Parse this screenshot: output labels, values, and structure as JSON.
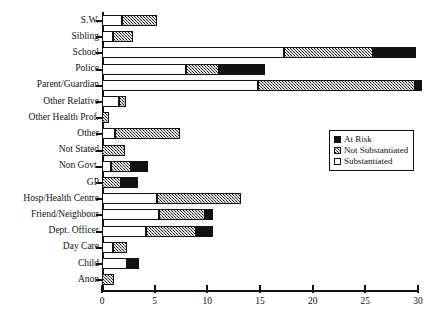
{
  "artifact": {
    "clipped_text_top": ""
  },
  "legend": {
    "position": "inside-right-middle",
    "items": [
      {
        "key": "at_risk",
        "label": "At Risk",
        "swatch": "solid-black",
        "color": "#111111"
      },
      {
        "key": "not_substantiated",
        "label": "Not Substantiated",
        "swatch": "stipple",
        "color": "#6e6e6e"
      },
      {
        "key": "substantiated",
        "label": "Substantiated",
        "swatch": "open-white",
        "color": "#ffffff"
      }
    ]
  },
  "axis": {
    "x_ticks": [
      "0",
      "5",
      "10",
      "15",
      "20",
      "25",
      "30"
    ],
    "x_min": 0,
    "x_max": 30
  },
  "chart_data": {
    "type": "bar",
    "orientation": "horizontal",
    "stacked": true,
    "title": "",
    "xlabel": "",
    "ylabel": "",
    "xlim": [
      0,
      30
    ],
    "ylim": null,
    "grid": false,
    "legend_position": "center-right",
    "xticks": [
      0,
      5,
      10,
      15,
      20,
      25,
      30
    ],
    "categories": [
      "S.W.",
      "Sibling",
      "School",
      "Police",
      "Parent/Guardian",
      "Other Relative",
      "Other Health Prof.",
      "Other",
      "Not Stated",
      "Non Govt.",
      "GP",
      "Hosp/Health Centre",
      "Friend/Neighbour",
      "Dept. Officer",
      "Day Care",
      "Child",
      "Anon"
    ],
    "series": [
      {
        "name": "Substantiated",
        "color": "#ffffff",
        "values": [
          1.9,
          1.0,
          17.3,
          8.0,
          14.8,
          1.6,
          0.0,
          1.2,
          0.0,
          0.9,
          0.0,
          5.2,
          5.4,
          4.2,
          1.0,
          2.4,
          0.0
        ]
      },
      {
        "name": "Not Substantiated",
        "color": "#6e6e6e",
        "values": [
          3.3,
          1.9,
          8.4,
          3.1,
          14.9,
          0.7,
          0.7,
          6.2,
          2.2,
          1.9,
          1.8,
          8.0,
          4.4,
          4.7,
          1.4,
          0.0,
          1.1
        ]
      },
      {
        "name": "At Risk",
        "color": "#111111",
        "values": [
          0.0,
          0.0,
          4.1,
          4.4,
          0.7,
          0.0,
          0.0,
          0.0,
          0.0,
          1.6,
          1.6,
          0.0,
          0.7,
          1.6,
          0.0,
          1.1,
          0.0
        ]
      }
    ],
    "totals": [
      5.2,
      2.9,
      29.8,
      15.5,
      30.4,
      2.3,
      0.7,
      7.4,
      2.2,
      4.4,
      3.4,
      13.2,
      10.5,
      10.5,
      2.4,
      3.5,
      1.1
    ]
  }
}
